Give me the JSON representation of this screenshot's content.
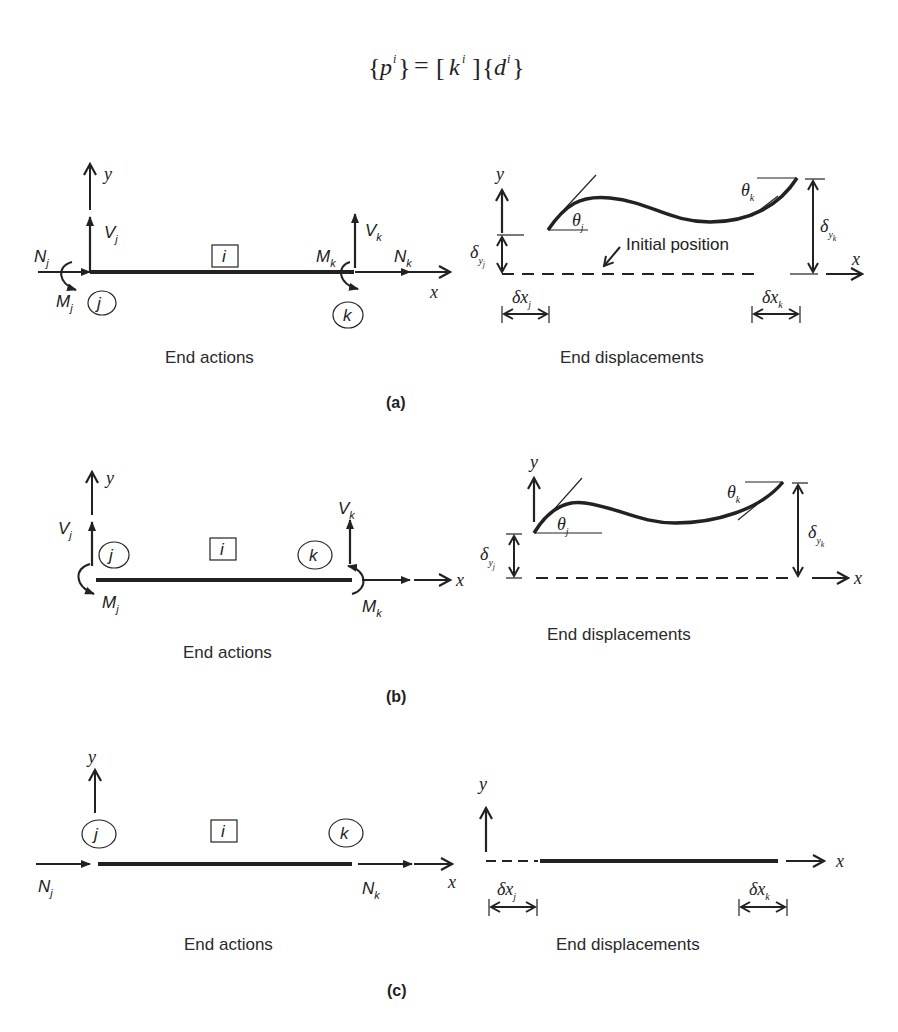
{
  "equation": {
    "lhs_vector": "p",
    "matrix": "k",
    "rhs_vector": "d",
    "superscript": "i",
    "equals": "="
  },
  "panels": [
    {
      "label": "(a)",
      "actions": {
        "caption": "End actions",
        "member_label": "i",
        "node_j": "j",
        "node_k": "k",
        "axis_x": "x",
        "axis_y": "y",
        "forces": [
          {
            "symbol": "N",
            "sub": "j"
          },
          {
            "symbol": "V",
            "sub": "j"
          },
          {
            "symbol": "M",
            "sub": "j"
          },
          {
            "symbol": "N",
            "sub": "k"
          },
          {
            "symbol": "V",
            "sub": "k"
          },
          {
            "symbol": "M",
            "sub": "k"
          }
        ]
      },
      "displacements": {
        "caption": "End displacements",
        "annotation": "Initial position",
        "axis_x": "x",
        "axis_y": "y",
        "symbols": [
          {
            "symbol": "θ",
            "sub": "j"
          },
          {
            "symbol": "θ",
            "sub": "k"
          },
          {
            "symbol": "δ",
            "sub": "yj"
          },
          {
            "symbol": "δ",
            "sub": "yk"
          },
          {
            "symbol": "δx",
            "sub": "j"
          },
          {
            "symbol": "δx",
            "sub": "k"
          }
        ]
      }
    },
    {
      "label": "(b)",
      "actions": {
        "caption": "End actions",
        "member_label": "i",
        "node_j": "j",
        "node_k": "k",
        "axis_x": "x",
        "axis_y": "y",
        "forces": [
          {
            "symbol": "V",
            "sub": "j"
          },
          {
            "symbol": "M",
            "sub": "j"
          },
          {
            "symbol": "V",
            "sub": "k"
          },
          {
            "symbol": "M",
            "sub": "k"
          }
        ]
      },
      "displacements": {
        "caption": "End displacements",
        "axis_x": "x",
        "axis_y": "y",
        "symbols": [
          {
            "symbol": "θ",
            "sub": "j"
          },
          {
            "symbol": "θ",
            "sub": "k"
          },
          {
            "symbol": "δ",
            "sub": "yj"
          },
          {
            "symbol": "δ",
            "sub": "yk"
          }
        ]
      }
    },
    {
      "label": "(c)",
      "actions": {
        "caption": "End actions",
        "member_label": "i",
        "node_j": "j",
        "node_k": "k",
        "axis_x": "x",
        "axis_y": "y",
        "forces": [
          {
            "symbol": "N",
            "sub": "j"
          },
          {
            "symbol": "N",
            "sub": "k"
          }
        ]
      },
      "displacements": {
        "caption": "End displacements",
        "axis_x": "x",
        "axis_y": "y",
        "symbols": [
          {
            "symbol": "δx",
            "sub": "j"
          },
          {
            "symbol": "δx",
            "sub": "k"
          }
        ]
      }
    }
  ]
}
